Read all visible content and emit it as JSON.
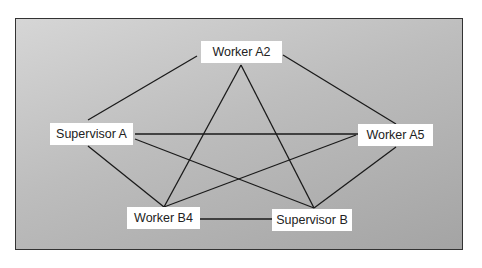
{
  "diagram": {
    "title": "",
    "nodes": [
      {
        "id": "a2",
        "label": "Worker A2",
        "x": 201,
        "y": 41,
        "w": 81
      },
      {
        "id": "sa",
        "label": "Supervisor A",
        "x": 50,
        "y": 123,
        "w": 83
      },
      {
        "id": "a5",
        "label": "Worker A5",
        "x": 358,
        "y": 124,
        "w": 75
      },
      {
        "id": "b4",
        "label": "Worker B4",
        "x": 127,
        "y": 207,
        "w": 73
      },
      {
        "id": "sb",
        "label": "Supervisor B",
        "x": 272,
        "y": 210,
        "w": 80
      }
    ],
    "edges": [
      {
        "from": "a2",
        "to": "sa"
      },
      {
        "from": "a2",
        "to": "a5"
      },
      {
        "from": "a2",
        "to": "b4"
      },
      {
        "from": "a2",
        "to": "sb"
      },
      {
        "from": "sa",
        "to": "a5"
      },
      {
        "from": "sa",
        "to": "b4"
      },
      {
        "from": "sa",
        "to": "sb"
      },
      {
        "from": "a5",
        "to": "b4"
      },
      {
        "from": "a5",
        "to": "sb"
      },
      {
        "from": "b4",
        "to": "sb"
      }
    ]
  }
}
